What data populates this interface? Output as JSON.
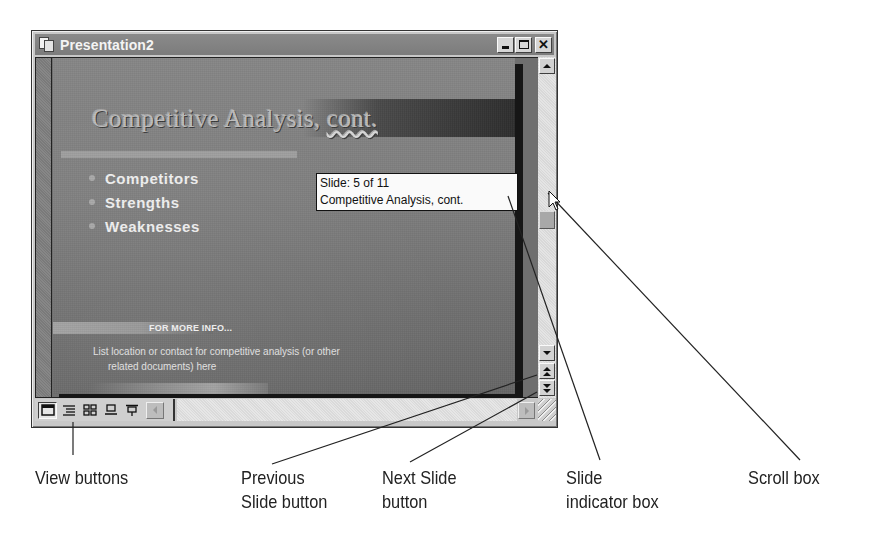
{
  "window": {
    "title": "Presentation2",
    "controls": {
      "minimize": "minimize",
      "maximize": "maximize",
      "close": "close"
    }
  },
  "slide": {
    "title_main": "Competitive Analysis, ",
    "title_tail": "cont.",
    "bullets": [
      "Competitors",
      "Strengths",
      "Weaknesses"
    ],
    "info_label": "FOR MORE INFO...",
    "info_line1": "List location or contact for competitive analysis (or other",
    "info_line2": "related documents) here"
  },
  "slide_indicator": {
    "line1": "Slide: 5 of 11",
    "line2": "Competitive Analysis, cont.",
    "current_slide": 5,
    "total_slides": 11
  },
  "view_buttons": [
    {
      "name": "normal-view",
      "icon": "normal-view-icon"
    },
    {
      "name": "outline-view",
      "icon": "outline-view-icon"
    },
    {
      "name": "slide-sorter-view",
      "icon": "slide-sorter-icon"
    },
    {
      "name": "notes-page-view",
      "icon": "notes-page-icon"
    },
    {
      "name": "slide-show",
      "icon": "slide-show-icon"
    }
  ],
  "annotations": {
    "view_buttons": "View buttons",
    "previous_slide_l1": "Previous",
    "previous_slide_l2": "Slide button",
    "next_slide_l1": "Next Slide",
    "next_slide_l2": "button",
    "slide_indicator_l1": "Slide",
    "slide_indicator_l2": "indicator box",
    "scroll_box": "Scroll box"
  },
  "colors": {
    "titlebar": "#7c7c7c",
    "slide_bg": "#7f7f7f",
    "caption_text": "#222222"
  }
}
